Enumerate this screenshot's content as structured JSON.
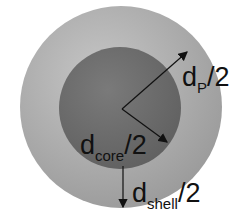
{
  "diagram": {
    "type": "core-shell particle cross-section",
    "colors": {
      "background": "#ffffff",
      "shell": "#a8a8a8",
      "shell_light": "#c2c2c2",
      "core": "#6e6e6e",
      "arrows": "#111111"
    },
    "labels": {
      "particle": {
        "main": "d",
        "sub": "P",
        "suffix": "/2"
      },
      "core": {
        "main": "d",
        "sub": "core",
        "suffix": "/2"
      },
      "shell": {
        "main": "d",
        "sub": "shell",
        "suffix": "/2"
      }
    }
  }
}
